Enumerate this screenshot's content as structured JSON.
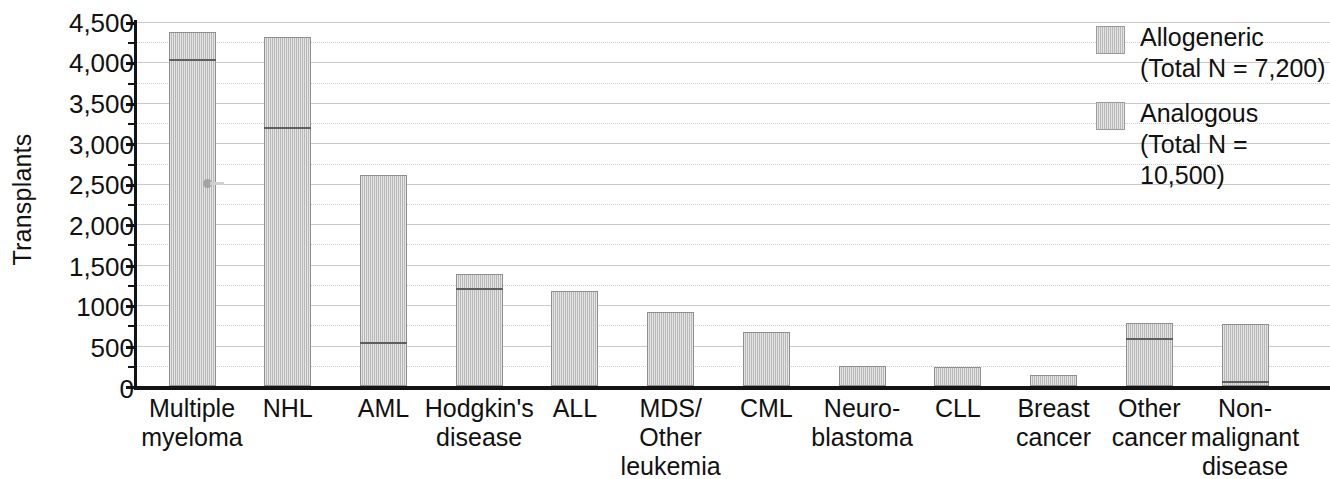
{
  "chart_data": {
    "type": "bar",
    "title": "",
    "subtitle": "",
    "xlabel": "",
    "ylabel": "Transplants",
    "ylim": [
      0,
      4500
    ],
    "ytick_values": [
      0,
      500,
      1000,
      1500,
      2000,
      2500,
      3000,
      3500,
      4000,
      4500
    ],
    "ytick_labels": [
      "0",
      "500",
      "1000",
      "1,500",
      "2,000",
      "2,500",
      "3,000",
      "3,500",
      "4,000",
      "4,500"
    ],
    "yminor_step": 250,
    "grid": true,
    "grid_axis": "y",
    "legend_position": "top-right",
    "stacked": true,
    "categories": [
      "Multiple\nmyeloma",
      "NHL",
      "AML",
      "Hodgkin's\ndisease",
      "ALL",
      "MDS/\nOther\nleukemia",
      "CML",
      "Neuro-\nblastoma",
      "CLL",
      "Breast\ncancer",
      "Other\ncancer",
      "Non-\nmalignant\ndisease"
    ],
    "series": [
      {
        "name": "Analogous",
        "legend_label": "Analogous\n(Total N = 10,500)",
        "color": "#c6c6c6",
        "values": [
          4040,
          3200,
          550,
          1215,
          1180,
          910,
          665,
          250,
          240,
          130,
          590,
          60
        ]
      },
      {
        "name": "Allogeneric",
        "legend_label": "Allogeneric\n(Total N = 7,200)",
        "color": "#c6c6c6",
        "values": [
          340,
          1110,
          2060,
          175,
          0,
          0,
          0,
          0,
          0,
          0,
          185,
          710
        ]
      }
    ],
    "totals": [
      4380,
      4310,
      2610,
      1390,
      1180,
      910,
      665,
      250,
      240,
      130,
      775,
      770
    ],
    "legend_entries": [
      {
        "label": "Allogeneric",
        "detail": "(Total N = 7,200)",
        "total_n": "7,200"
      },
      {
        "label": "Analogous",
        "detail": "(Total N = 10,500)",
        "total_n": "10,500"
      }
    ]
  },
  "axis": {
    "y_title": "Transplants",
    "tick_0": "0",
    "tick_500": "500",
    "tick_1000": "1000",
    "tick_1500": "1,500",
    "tick_2000": "2,000",
    "tick_2500": "2,500",
    "tick_3000": "3,000",
    "tick_3500": "3,500",
    "tick_4000": "4,000",
    "tick_4500": "4,500"
  },
  "legend": {
    "entry_1_label": "Allogeneric",
    "entry_1_detail": "(Total N = 7,200)",
    "entry_2_label": "Analogous",
    "entry_2_detail": "(Total N = 10,500)"
  },
  "categories_text": {
    "c0": "Multiple\nmyeloma",
    "c1": "NHL",
    "c2": "AML",
    "c3": "Hodgkin's\ndisease",
    "c4": "ALL",
    "c5": "MDS/\nOther\nleukemia",
    "c6": "CML",
    "c7": "Neuro-\nblastoma",
    "c8": "CLL",
    "c9": "Breast\ncancer",
    "c10": "Other\ncancer",
    "c11": "Non-\nmalignant\ndisease"
  },
  "colors": {
    "bar_fill": "#c6c6c6",
    "bar_edge": "#8f8f8f",
    "axis": "#141414",
    "grid": "#d6d6d6",
    "text": "#111111"
  }
}
